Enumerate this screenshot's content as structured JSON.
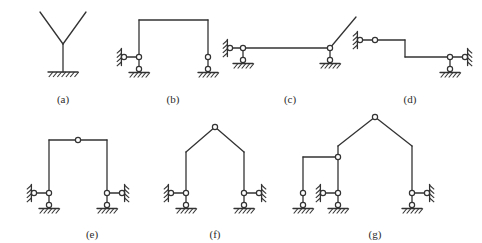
{
  "figure": {
    "background_color": "#ffffff",
    "line_color": "#333333",
    "hinge_fill": "#ffffff",
    "caption_color": "#2b2b2b",
    "width": 482,
    "height": 243
  },
  "diagrams": [
    {
      "id": "a",
      "caption": "(a)",
      "caption_x": 63,
      "caption_y": 93,
      "description": "Y-shaped member on a fixed base support",
      "members": [
        {
          "name": "left-branch",
          "x1": 40,
          "y1": 12,
          "x2": 63,
          "y2": 44
        },
        {
          "name": "right-branch",
          "x1": 86,
          "y1": 12,
          "x2": 63,
          "y2": 44
        },
        {
          "name": "stem",
          "x1": 63,
          "y1": 44,
          "x2": 63,
          "y2": 72
        }
      ],
      "hinges": [],
      "supports": [
        {
          "name": "fixed-support-base",
          "type": "fixed",
          "x": 63,
          "y": 72,
          "width": 30
        }
      ]
    },
    {
      "id": "b",
      "caption": "(b)",
      "caption_x": 173,
      "caption_y": 93,
      "description": "Portal frame, pin on vertical link at each column base, horizontal wall link at left",
      "members": [
        {
          "name": "left-column",
          "x1": 139,
          "y1": 20,
          "x2": 139,
          "y2": 57
        },
        {
          "name": "top-beam",
          "x1": 139,
          "y1": 20,
          "x2": 208,
          "y2": 20
        },
        {
          "name": "right-column",
          "x1": 208,
          "y1": 20,
          "x2": 208,
          "y2": 57
        }
      ],
      "hinges": [],
      "supports": [
        {
          "name": "left-base-pin-on-link",
          "type": "pin-vertical-link",
          "x": 139,
          "y": 57
        },
        {
          "name": "left-wall-horizontal-link",
          "type": "horizontal-wall-link",
          "x": 139,
          "y": 57,
          "wall_x": 124
        },
        {
          "name": "right-base-pin-on-link",
          "type": "pin-vertical-link",
          "x": 208,
          "y": 57
        }
      ]
    },
    {
      "id": "c",
      "caption": "(c)",
      "caption_x": 290,
      "caption_y": 93,
      "description": "Horizontal beam with inclined member at right end, pin-on-link supports",
      "members": [
        {
          "name": "main-beam",
          "x1": 243,
          "y1": 48,
          "x2": 330,
          "y2": 48
        },
        {
          "name": "inclined-member",
          "x1": 330,
          "y1": 48,
          "x2": 356,
          "y2": 17
        }
      ],
      "hinges": [],
      "supports": [
        {
          "name": "left-beam-pin-on-link",
          "type": "pin-vertical-link",
          "x": 243,
          "y": 48
        },
        {
          "name": "left-wall-horizontal-link",
          "type": "horizontal-wall-link",
          "x": 243,
          "y": 48,
          "wall_x": 230
        },
        {
          "name": "right-beam-pin-on-link",
          "type": "pin-vertical-link",
          "x": 330,
          "y": 48
        }
      ]
    },
    {
      "id": "d",
      "caption": "(d)",
      "caption_x": 410,
      "caption_y": 93,
      "description": "Stepped beam with internal hinge, wall-linked at both ends",
      "members": [
        {
          "name": "left-segment",
          "x1": 360,
          "y1": 40,
          "x2": 405,
          "y2": 40
        },
        {
          "name": "vertical-step",
          "x1": 405,
          "y1": 40,
          "x2": 405,
          "y2": 57
        },
        {
          "name": "right-segment",
          "x1": 405,
          "y1": 57,
          "x2": 450,
          "y2": 57
        }
      ],
      "hinges": [
        {
          "name": "internal-hinge-left-segment",
          "x": 375,
          "y": 40
        }
      ],
      "supports": [
        {
          "name": "left-wall-pin",
          "type": "wall-pin-left",
          "x": 360,
          "y": 40
        },
        {
          "name": "right-base-pin-on-link",
          "type": "pin-vertical-link",
          "x": 450,
          "y": 57
        },
        {
          "name": "right-wall-horizontal-link",
          "type": "horizontal-wall-link-right",
          "x": 450,
          "y": 57,
          "wall_x": 465
        }
      ]
    },
    {
      "id": "e",
      "caption": "(e)",
      "caption_x": 92,
      "caption_y": 228,
      "description": "Portal frame with mid-span hinge in beam, horizontal wall links at both bases",
      "members": [
        {
          "name": "left-column",
          "x1": 49,
          "y1": 140,
          "x2": 49,
          "y2": 193
        },
        {
          "name": "beam-left-half",
          "x1": 49,
          "y1": 140,
          "x2": 78,
          "y2": 140
        },
        {
          "name": "beam-right-half",
          "x1": 78,
          "y1": 140,
          "x2": 107,
          "y2": 140
        },
        {
          "name": "right-column",
          "x1": 107,
          "y1": 140,
          "x2": 107,
          "y2": 193
        }
      ],
      "hinges": [
        {
          "name": "beam-midspan-hinge",
          "x": 78,
          "y": 140
        }
      ],
      "supports": [
        {
          "name": "left-base-pin-on-link",
          "type": "pin-vertical-link",
          "x": 49,
          "y": 193
        },
        {
          "name": "left-wall-horizontal-link",
          "type": "horizontal-wall-link",
          "x": 49,
          "y": 193,
          "wall_x": 34
        },
        {
          "name": "right-base-pin-on-link",
          "type": "pin-vertical-link",
          "x": 107,
          "y": 193
        },
        {
          "name": "right-wall-horizontal-link",
          "type": "horizontal-wall-link-right",
          "x": 107,
          "y": 193,
          "wall_x": 122
        }
      ]
    },
    {
      "id": "f",
      "caption": "(f)",
      "caption_x": 215,
      "caption_y": 228,
      "description": "Gable frame with apex hinge and horizontal wall links at both bases",
      "members": [
        {
          "name": "left-column",
          "x1": 186,
          "y1": 152,
          "x2": 186,
          "y2": 193
        },
        {
          "name": "left-rafter",
          "x1": 186,
          "y1": 152,
          "x2": 215,
          "y2": 127
        },
        {
          "name": "right-rafter",
          "x1": 215,
          "y1": 127,
          "x2": 244,
          "y2": 152
        },
        {
          "name": "right-column",
          "x1": 244,
          "y1": 152,
          "x2": 244,
          "y2": 193
        }
      ],
      "hinges": [
        {
          "name": "apex-hinge",
          "x": 215,
          "y": 127
        }
      ],
      "supports": [
        {
          "name": "left-base-pin-on-link",
          "type": "pin-vertical-link",
          "x": 186,
          "y": 193
        },
        {
          "name": "left-wall-horizontal-link",
          "type": "horizontal-wall-link",
          "x": 186,
          "y": 193,
          "wall_x": 171
        },
        {
          "name": "right-base-pin-on-link",
          "type": "pin-vertical-link",
          "x": 244,
          "y": 193
        },
        {
          "name": "right-wall-horizontal-link",
          "type": "horizontal-wall-link-right",
          "x": 244,
          "y": 193,
          "wall_x": 259
        }
      ]
    },
    {
      "id": "g",
      "caption": "(g)",
      "caption_x": 375,
      "caption_y": 228,
      "description": "Gable frame with three columns and an attached left side bay joined by a hinge",
      "members": [
        {
          "name": "side-bay-column",
          "x1": 303,
          "y1": 157,
          "x2": 303,
          "y2": 193
        },
        {
          "name": "side-bay-beam",
          "x1": 303,
          "y1": 157,
          "x2": 338,
          "y2": 157
        },
        {
          "name": "middle-column",
          "x1": 338,
          "y1": 146,
          "x2": 338,
          "y2": 193
        },
        {
          "name": "left-rafter",
          "x1": 338,
          "y1": 146,
          "x2": 375,
          "y2": 117
        },
        {
          "name": "right-rafter",
          "x1": 375,
          "y1": 117,
          "x2": 412,
          "y2": 146
        },
        {
          "name": "right-column",
          "x1": 412,
          "y1": 146,
          "x2": 412,
          "y2": 193
        }
      ],
      "hinges": [
        {
          "name": "apex-hinge",
          "x": 375,
          "y": 117
        },
        {
          "name": "side-bay-connection-hinge",
          "x": 338,
          "y": 157
        }
      ],
      "supports": [
        {
          "name": "side-bay-base-pin-on-link",
          "type": "pin-vertical-link",
          "x": 303,
          "y": 193
        },
        {
          "name": "middle-base-pin-on-link",
          "type": "pin-vertical-link",
          "x": 338,
          "y": 193
        },
        {
          "name": "middle-wall-horizontal-link",
          "type": "horizontal-wall-link",
          "x": 338,
          "y": 193,
          "wall_x": 323
        },
        {
          "name": "right-base-pin-on-link",
          "type": "pin-vertical-link",
          "x": 412,
          "y": 193
        },
        {
          "name": "right-wall-horizontal-link",
          "type": "horizontal-wall-link-right",
          "x": 412,
          "y": 193,
          "wall_x": 427
        }
      ]
    }
  ]
}
